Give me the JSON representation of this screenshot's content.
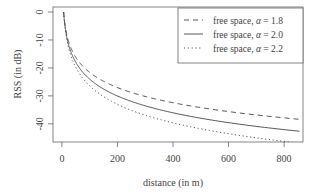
{
  "chart_data": {
    "type": "line",
    "title": "",
    "xlabel": "distance (in m)",
    "ylabel": "RSS (in dB)",
    "xlim": [
      -32,
      868
    ],
    "ylim": [
      -46.5,
      1.8
    ],
    "xticks": [
      0,
      200,
      400,
      600,
      800
    ],
    "yticks": [
      0,
      -10,
      -20,
      -30,
      -40
    ],
    "grid": false,
    "legend_position": "top-right",
    "model": "RSS = -10 * alpha * log10(d / 6.3)",
    "series": [
      {
        "name": "free space, α = 1.8",
        "alpha": 1.8,
        "style": "dashed",
        "x": [
          6.3,
          10,
          20,
          50,
          100,
          200,
          300,
          400,
          500,
          600,
          700,
          800,
          865
        ],
        "y": [
          0,
          -3.6,
          -9.0,
          -16.2,
          -21.6,
          -27.0,
          -30.2,
          -32.4,
          -34.2,
          -35.6,
          -36.8,
          -37.9,
          -38.5
        ]
      },
      {
        "name": "free space, α = 2.0",
        "alpha": 2.0,
        "style": "solid",
        "x": [
          6.3,
          10,
          20,
          50,
          100,
          200,
          300,
          400,
          500,
          600,
          700,
          800,
          865
        ],
        "y": [
          0,
          -4.0,
          -10.0,
          -18.0,
          -24.0,
          -30.0,
          -33.6,
          -36.1,
          -38.0,
          -39.6,
          -40.9,
          -42.1,
          -42.7
        ]
      },
      {
        "name": "free space, α = 2.2",
        "alpha": 2.2,
        "style": "dotted",
        "x": [
          6.3,
          10,
          20,
          50,
          100,
          200,
          300,
          400,
          500,
          600,
          700,
          800,
          865
        ],
        "y": [
          0,
          -4.4,
          -11.0,
          -19.8,
          -26.4,
          -33.0,
          -36.9,
          -39.7,
          -41.8,
          -43.5,
          -45.0,
          -46.3,
          -47.0
        ]
      }
    ]
  },
  "legend": {
    "items": [
      {
        "label_prefix": "free space, ",
        "symbol": "α",
        "value": " = 1.8"
      },
      {
        "label_prefix": "free space, ",
        "symbol": "α",
        "value": " = 2.0"
      },
      {
        "label_prefix": "free space, ",
        "symbol": "α",
        "value": " = 2.2"
      }
    ]
  },
  "axes": {
    "x_ticks": [
      "0",
      "200",
      "400",
      "600",
      "800"
    ],
    "y_ticks": [
      "0",
      "-10",
      "-20",
      "-30",
      "-40"
    ]
  },
  "colors": {
    "axis": "#555555",
    "line": "#444444"
  }
}
